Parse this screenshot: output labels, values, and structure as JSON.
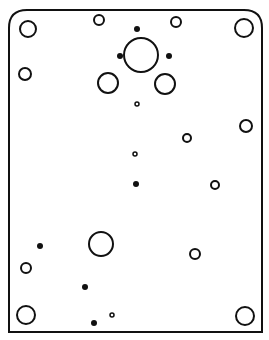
{
  "diagram": {
    "stroke_color": "#111111",
    "fill_color": "#ffffff",
    "plate": {
      "x": 9,
      "y": 10,
      "width": 253,
      "height": 322,
      "top_corner_radius": 18
    },
    "holes": [
      {
        "id": "corner-top-left",
        "cx": 28,
        "cy": 29,
        "r": 8,
        "type": "open"
      },
      {
        "id": "corner-top-right",
        "cx": 244,
        "cy": 28,
        "r": 9,
        "type": "open"
      },
      {
        "id": "top-small-left",
        "cx": 99,
        "cy": 20,
        "r": 5,
        "type": "open"
      },
      {
        "id": "top-small-right",
        "cx": 176,
        "cy": 22,
        "r": 5,
        "type": "open"
      },
      {
        "id": "center-large",
        "cx": 141,
        "cy": 55,
        "r": 17,
        "type": "open"
      },
      {
        "id": "center-dot-top",
        "cx": 137,
        "cy": 29,
        "r": 3,
        "type": "filled"
      },
      {
        "id": "center-dot-left",
        "cx": 120,
        "cy": 56,
        "r": 3,
        "type": "filled"
      },
      {
        "id": "center-dot-right",
        "cx": 169,
        "cy": 56,
        "r": 3,
        "type": "filled"
      },
      {
        "id": "center-medium-left",
        "cx": 108,
        "cy": 83,
        "r": 10,
        "type": "open"
      },
      {
        "id": "center-medium-right",
        "cx": 165,
        "cy": 84,
        "r": 10,
        "type": "open"
      },
      {
        "id": "center-tiny",
        "cx": 137,
        "cy": 104,
        "r": 2,
        "type": "open"
      },
      {
        "id": "left-upper",
        "cx": 25,
        "cy": 74,
        "r": 6,
        "type": "open"
      },
      {
        "id": "right-upper",
        "cx": 246,
        "cy": 126,
        "r": 6,
        "type": "open"
      },
      {
        "id": "mid-right-small",
        "cx": 187,
        "cy": 138,
        "r": 4,
        "type": "open"
      },
      {
        "id": "mid-center-tiny",
        "cx": 135,
        "cy": 154,
        "r": 2,
        "type": "open"
      },
      {
        "id": "mid-center-dot",
        "cx": 136,
        "cy": 184,
        "r": 3,
        "type": "filled"
      },
      {
        "id": "mid-right-lower",
        "cx": 215,
        "cy": 185,
        "r": 4,
        "type": "open"
      },
      {
        "id": "lower-left-dot",
        "cx": 40,
        "cy": 246,
        "r": 3,
        "type": "filled"
      },
      {
        "id": "lower-large",
        "cx": 101,
        "cy": 244,
        "r": 12,
        "type": "open"
      },
      {
        "id": "lower-left-small",
        "cx": 26,
        "cy": 268,
        "r": 5,
        "type": "open"
      },
      {
        "id": "lower-right-small",
        "cx": 195,
        "cy": 254,
        "r": 5,
        "type": "open"
      },
      {
        "id": "lower-center-dot",
        "cx": 85,
        "cy": 287,
        "r": 3,
        "type": "filled"
      },
      {
        "id": "corner-bottom-left",
        "cx": 26,
        "cy": 315,
        "r": 9,
        "type": "open"
      },
      {
        "id": "bottom-tiny",
        "cx": 112,
        "cy": 315,
        "r": 2,
        "type": "open"
      },
      {
        "id": "bottom-dot",
        "cx": 94,
        "cy": 323,
        "r": 3,
        "type": "filled"
      },
      {
        "id": "corner-bottom-right",
        "cx": 245,
        "cy": 316,
        "r": 9,
        "type": "open"
      }
    ]
  }
}
